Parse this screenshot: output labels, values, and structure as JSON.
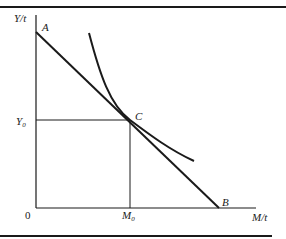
{
  "diagram": {
    "type": "economics-indifference-budget",
    "axes": {
      "y_label": "Y/t",
      "x_label": "M/t",
      "origin_label": "0"
    },
    "points": {
      "A": "A",
      "B": "B",
      "C": "C"
    },
    "ticks": {
      "y0_label": "Y",
      "y0_sub": "0",
      "m0_label": "M",
      "m0_sub": "0"
    },
    "elements": [
      {
        "id": "budget-line",
        "from": "A",
        "to": "B",
        "description": "Straight budget line from A on Y-axis to B on M-axis"
      },
      {
        "id": "indifference-curve",
        "description": "Convex curve tangent to budget line at C"
      },
      {
        "id": "y0-guide",
        "description": "Horizontal line from Y0 on Y-axis to C"
      },
      {
        "id": "m0-guide",
        "description": "Vertical line from C down to M0 on M-axis"
      }
    ],
    "colors": {
      "ink": "#1a1a1a",
      "background": "#ffffff"
    }
  }
}
